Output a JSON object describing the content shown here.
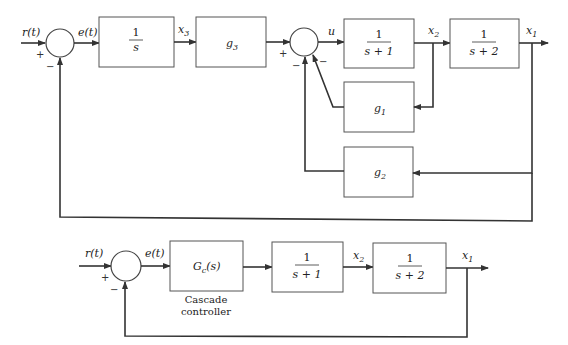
{
  "top_diagram": {
    "input_label": "r(t)",
    "error_label": "e(t)",
    "sum1_signs": {
      "in": "+",
      "feedback": "−"
    },
    "integrator": {
      "num": "1",
      "den": "s"
    },
    "x3_label": {
      "base": "x",
      "sub": "3"
    },
    "g3_block": {
      "base": "g",
      "sub": "3"
    },
    "sum2_signs": {
      "in": "+",
      "fb_left": "−",
      "fb_right": "−"
    },
    "u_label": "u",
    "plant1": {
      "num": "1",
      "den": "s + 1"
    },
    "x2_label": {
      "base": "x",
      "sub": "2"
    },
    "plant2": {
      "num": "1",
      "den": "s + 2"
    },
    "x1_label": {
      "base": "x",
      "sub": "1"
    },
    "g1_block": {
      "base": "g",
      "sub": "1"
    },
    "g2_block": {
      "base": "g",
      "sub": "2"
    }
  },
  "bottom_diagram": {
    "input_label": "r(t)",
    "error_label": "e(t)",
    "sum_signs": {
      "in": "+",
      "feedback": "−"
    },
    "controller": {
      "base": "G",
      "sub": "c",
      "arg": "(s)"
    },
    "controller_caption": [
      "Cascade",
      "controller"
    ],
    "plant1": {
      "num": "1",
      "den": "s + 1"
    },
    "x2_label": {
      "base": "x",
      "sub": "2"
    },
    "plant2": {
      "num": "1",
      "den": "s + 2"
    },
    "x1_label": {
      "base": "x",
      "sub": "1"
    }
  }
}
